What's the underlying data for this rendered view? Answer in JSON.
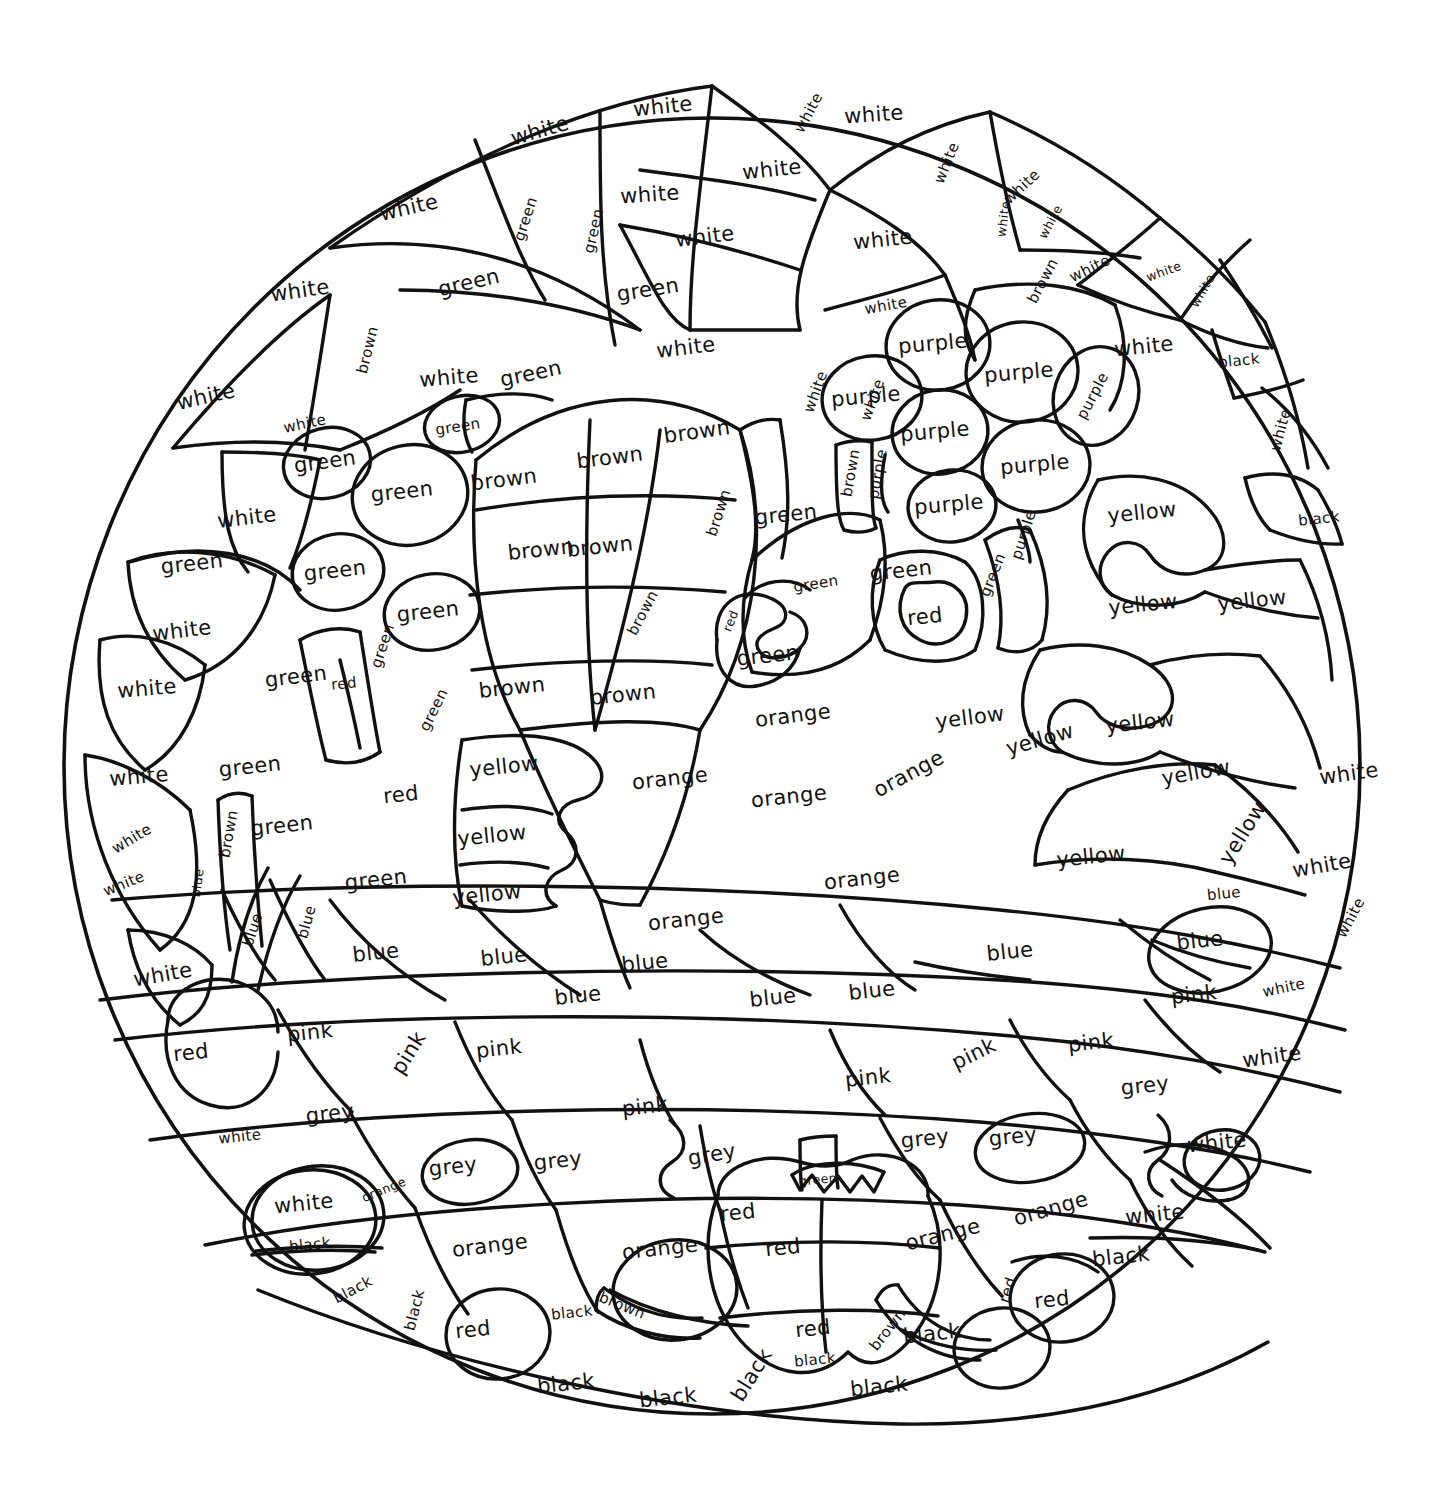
{
  "page": {
    "kind": "color-by-word-coloring-sheet",
    "shape": "circle-mandala",
    "background": "#ffffff",
    "ink": "#111111",
    "width": 1453,
    "height": 1509
  },
  "palette": {
    "white": "#ffffff",
    "green": "#2e8b36",
    "brown": "#7b4a21",
    "purple": "#7b3fa0",
    "yellow": "#f2c232",
    "orange": "#ef8127",
    "red": "#d8352a",
    "blue": "#2f6fd0",
    "pink": "#ef8bb6",
    "grey": "#8c8c8c",
    "black": "#111111"
  },
  "legend_words": [
    "white",
    "green",
    "brown",
    "purple",
    "yellow",
    "orange",
    "red",
    "blue",
    "pink",
    "grey",
    "black"
  ],
  "regions": [
    {
      "text": "white",
      "x": 540,
      "y": 131,
      "rot": -16,
      "size": "lg"
    },
    {
      "text": "white",
      "x": 663,
      "y": 107,
      "rot": -6,
      "size": "lg"
    },
    {
      "text": "white",
      "x": 809,
      "y": 113,
      "rot": -62,
      "size": "sm"
    },
    {
      "text": "white",
      "x": 874,
      "y": 115,
      "rot": -4,
      "size": "lg"
    },
    {
      "text": "white",
      "x": 409,
      "y": 208,
      "rot": -13,
      "size": "lg"
    },
    {
      "text": "white",
      "x": 650,
      "y": 195,
      "rot": -4,
      "size": "lg"
    },
    {
      "text": "white",
      "x": 772,
      "y": 170,
      "rot": -6,
      "size": "lg"
    },
    {
      "text": "white",
      "x": 947,
      "y": 163,
      "rot": -68,
      "size": "sm"
    },
    {
      "text": "white",
      "x": 1022,
      "y": 187,
      "rot": -43,
      "size": "sm"
    },
    {
      "text": "white",
      "x": 1004,
      "y": 219,
      "rot": -82,
      "size": "xs"
    },
    {
      "text": "white",
      "x": 1051,
      "y": 222,
      "rot": -62,
      "size": "xs"
    },
    {
      "text": "white",
      "x": 300,
      "y": 291,
      "rot": -8,
      "size": "lg"
    },
    {
      "text": "white",
      "x": 705,
      "y": 237,
      "rot": -7,
      "size": "lg"
    },
    {
      "text": "white",
      "x": 883,
      "y": 240,
      "rot": -6,
      "size": "lg"
    },
    {
      "text": "white",
      "x": 1090,
      "y": 269,
      "rot": -26,
      "size": "sm"
    },
    {
      "text": "white",
      "x": 1164,
      "y": 272,
      "rot": -20,
      "size": "xs"
    },
    {
      "text": "white",
      "x": 1203,
      "y": 291,
      "rot": -60,
      "size": "xs"
    },
    {
      "text": "white",
      "x": 886,
      "y": 306,
      "rot": -10,
      "size": "sm"
    },
    {
      "text": "white",
      "x": 1144,
      "y": 347,
      "rot": -6,
      "size": "lg"
    },
    {
      "text": "white",
      "x": 206,
      "y": 397,
      "rot": -13,
      "size": "lg"
    },
    {
      "text": "white",
      "x": 449,
      "y": 378,
      "rot": -5,
      "size": "lg"
    },
    {
      "text": "white",
      "x": 686,
      "y": 348,
      "rot": -7,
      "size": "lg"
    },
    {
      "text": "white",
      "x": 816,
      "y": 392,
      "rot": -70,
      "size": "sm"
    },
    {
      "text": "white",
      "x": 873,
      "y": 400,
      "rot": -70,
      "size": "sm"
    },
    {
      "text": "white",
      "x": 305,
      "y": 424,
      "rot": -12,
      "size": "sm"
    },
    {
      "text": "white",
      "x": 1281,
      "y": 430,
      "rot": -75,
      "size": "sm"
    },
    {
      "text": "white",
      "x": 247,
      "y": 518,
      "rot": -7,
      "size": "lg"
    },
    {
      "text": "white",
      "x": 182,
      "y": 631,
      "rot": -7,
      "size": "lg"
    },
    {
      "text": "white",
      "x": 147,
      "y": 689,
      "rot": -5,
      "size": "lg"
    },
    {
      "text": "white",
      "x": 139,
      "y": 777,
      "rot": -5,
      "size": "lg"
    },
    {
      "text": "white",
      "x": 132,
      "y": 839,
      "rot": -31,
      "size": "sm"
    },
    {
      "text": "white",
      "x": 124,
      "y": 884,
      "rot": -22,
      "size": "sm"
    },
    {
      "text": "white",
      "x": 163,
      "y": 975,
      "rot": -10,
      "size": "lg"
    },
    {
      "text": "white",
      "x": 1349,
      "y": 774,
      "rot": -8,
      "size": "lg"
    },
    {
      "text": "white",
      "x": 1322,
      "y": 866,
      "rot": -10,
      "size": "lg"
    },
    {
      "text": "white",
      "x": 1351,
      "y": 918,
      "rot": -62,
      "size": "sm"
    },
    {
      "text": "white",
      "x": 1284,
      "y": 988,
      "rot": -12,
      "size": "sm"
    },
    {
      "text": "white",
      "x": 1272,
      "y": 1057,
      "rot": -8,
      "size": "lg"
    },
    {
      "text": "white",
      "x": 1217,
      "y": 1143,
      "rot": -6,
      "size": "lg"
    },
    {
      "text": "white",
      "x": 1155,
      "y": 1215,
      "rot": -6,
      "size": "lg"
    },
    {
      "text": "white",
      "x": 240,
      "y": 1137,
      "rot": -6,
      "size": "sm"
    },
    {
      "text": "white",
      "x": 304,
      "y": 1204,
      "rot": -6,
      "size": "lg"
    },
    {
      "text": "green",
      "x": 526,
      "y": 219,
      "rot": -72,
      "size": "sm"
    },
    {
      "text": "green",
      "x": 594,
      "y": 231,
      "rot": -77,
      "size": "sm"
    },
    {
      "text": "green",
      "x": 469,
      "y": 283,
      "rot": -13,
      "size": "lg"
    },
    {
      "text": "green",
      "x": 648,
      "y": 290,
      "rot": -9,
      "size": "lg"
    },
    {
      "text": "green",
      "x": 531,
      "y": 374,
      "rot": -12,
      "size": "lg"
    },
    {
      "text": "green",
      "x": 458,
      "y": 427,
      "rot": -9,
      "size": "sm"
    },
    {
      "text": "green",
      "x": 325,
      "y": 462,
      "rot": -8,
      "size": "lg"
    },
    {
      "text": "green",
      "x": 402,
      "y": 492,
      "rot": -6,
      "size": "lg"
    },
    {
      "text": "green",
      "x": 192,
      "y": 564,
      "rot": -6,
      "size": "lg"
    },
    {
      "text": "green",
      "x": 335,
      "y": 571,
      "rot": -6,
      "size": "lg"
    },
    {
      "text": "green",
      "x": 428,
      "y": 612,
      "rot": -6,
      "size": "lg"
    },
    {
      "text": "green",
      "x": 383,
      "y": 646,
      "rot": -72,
      "size": "sm"
    },
    {
      "text": "green",
      "x": 296,
      "y": 677,
      "rot": -7,
      "size": "lg"
    },
    {
      "text": "green",
      "x": 434,
      "y": 710,
      "rot": -64,
      "size": "sm"
    },
    {
      "text": "green",
      "x": 250,
      "y": 767,
      "rot": -6,
      "size": "lg"
    },
    {
      "text": "green",
      "x": 282,
      "y": 826,
      "rot": -6,
      "size": "lg"
    },
    {
      "text": "green",
      "x": 376,
      "y": 880,
      "rot": -6,
      "size": "lg"
    },
    {
      "text": "green",
      "x": 786,
      "y": 515,
      "rot": -6,
      "size": "lg"
    },
    {
      "text": "green",
      "x": 816,
      "y": 584,
      "rot": -9,
      "size": "sm"
    },
    {
      "text": "green",
      "x": 768,
      "y": 656,
      "rot": -6,
      "size": "lg"
    },
    {
      "text": "green",
      "x": 901,
      "y": 571,
      "rot": -6,
      "size": "lg"
    },
    {
      "text": "green",
      "x": 993,
      "y": 575,
      "rot": -68,
      "size": "sm"
    },
    {
      "text": "green",
      "x": 818,
      "y": 1180,
      "rot": -5,
      "size": "xs"
    },
    {
      "text": "brown",
      "x": 368,
      "y": 350,
      "rot": -76,
      "size": "sm"
    },
    {
      "text": "brown",
      "x": 697,
      "y": 432,
      "rot": -8,
      "size": "lg"
    },
    {
      "text": "brown",
      "x": 610,
      "y": 458,
      "rot": -7,
      "size": "lg"
    },
    {
      "text": "brown",
      "x": 504,
      "y": 480,
      "rot": -7,
      "size": "lg"
    },
    {
      "text": "brown",
      "x": 541,
      "y": 550,
      "rot": -6,
      "size": "lg"
    },
    {
      "text": "brown",
      "x": 600,
      "y": 547,
      "rot": -6,
      "size": "lg"
    },
    {
      "text": "brown",
      "x": 719,
      "y": 513,
      "rot": -72,
      "size": "sm"
    },
    {
      "text": "brown",
      "x": 643,
      "y": 613,
      "rot": -62,
      "size": "sm"
    },
    {
      "text": "brown",
      "x": 512,
      "y": 688,
      "rot": -6,
      "size": "lg"
    },
    {
      "text": "brown",
      "x": 623,
      "y": 695,
      "rot": -6,
      "size": "lg"
    },
    {
      "text": "brown",
      "x": 851,
      "y": 473,
      "rot": -80,
      "size": "sm"
    },
    {
      "text": "brown",
      "x": 1043,
      "y": 281,
      "rot": -62,
      "size": "sm"
    },
    {
      "text": "brown",
      "x": 229,
      "y": 834,
      "rot": -80,
      "size": "sm"
    },
    {
      "text": "brown",
      "x": 622,
      "y": 1306,
      "rot": 22,
      "size": "sm"
    },
    {
      "text": "brown",
      "x": 888,
      "y": 1330,
      "rot": -52,
      "size": "sm"
    },
    {
      "text": "purple",
      "x": 933,
      "y": 344,
      "rot": -5,
      "size": "lg"
    },
    {
      "text": "purple",
      "x": 1019,
      "y": 373,
      "rot": -5,
      "size": "lg"
    },
    {
      "text": "purple",
      "x": 866,
      "y": 397,
      "rot": -5,
      "size": "lg"
    },
    {
      "text": "purple",
      "x": 935,
      "y": 432,
      "rot": -5,
      "size": "lg"
    },
    {
      "text": "purple",
      "x": 1093,
      "y": 396,
      "rot": -62,
      "size": "sm"
    },
    {
      "text": "purple",
      "x": 1035,
      "y": 465,
      "rot": -5,
      "size": "lg"
    },
    {
      "text": "purple",
      "x": 878,
      "y": 474,
      "rot": -80,
      "size": "sm"
    },
    {
      "text": "purple",
      "x": 949,
      "y": 505,
      "rot": -5,
      "size": "lg"
    },
    {
      "text": "purple",
      "x": 1024,
      "y": 535,
      "rot": -72,
      "size": "sm"
    },
    {
      "text": "yellow",
      "x": 1142,
      "y": 513,
      "rot": -6,
      "size": "lg"
    },
    {
      "text": "yellow",
      "x": 1143,
      "y": 605,
      "rot": -6,
      "size": "lg"
    },
    {
      "text": "yellow",
      "x": 1252,
      "y": 601,
      "rot": -6,
      "size": "lg"
    },
    {
      "text": "yellow",
      "x": 970,
      "y": 718,
      "rot": -7,
      "size": "lg"
    },
    {
      "text": "yellow",
      "x": 1040,
      "y": 740,
      "rot": -16,
      "size": "lg"
    },
    {
      "text": "yellow",
      "x": 1140,
      "y": 723,
      "rot": -6,
      "size": "lg"
    },
    {
      "text": "yellow",
      "x": 1196,
      "y": 773,
      "rot": -10,
      "size": "lg"
    },
    {
      "text": "yellow",
      "x": 1243,
      "y": 833,
      "rot": -58,
      "size": "lg"
    },
    {
      "text": "yellow",
      "x": 1091,
      "y": 857,
      "rot": -6,
      "size": "lg"
    },
    {
      "text": "yellow",
      "x": 504,
      "y": 767,
      "rot": -6,
      "size": "lg"
    },
    {
      "text": "yellow",
      "x": 492,
      "y": 836,
      "rot": -6,
      "size": "lg"
    },
    {
      "text": "yellow",
      "x": 487,
      "y": 895,
      "rot": -6,
      "size": "lg"
    },
    {
      "text": "orange",
      "x": 793,
      "y": 716,
      "rot": -7,
      "size": "lg"
    },
    {
      "text": "orange",
      "x": 670,
      "y": 779,
      "rot": -6,
      "size": "lg"
    },
    {
      "text": "orange",
      "x": 789,
      "y": 797,
      "rot": -6,
      "size": "lg"
    },
    {
      "text": "orange",
      "x": 909,
      "y": 774,
      "rot": -28,
      "size": "lg"
    },
    {
      "text": "orange",
      "x": 862,
      "y": 879,
      "rot": -6,
      "size": "lg"
    },
    {
      "text": "orange",
      "x": 686,
      "y": 920,
      "rot": -6,
      "size": "lg"
    },
    {
      "text": "orange",
      "x": 384,
      "y": 1190,
      "rot": -22,
      "size": "xs"
    },
    {
      "text": "orange",
      "x": 490,
      "y": 1246,
      "rot": -7,
      "size": "lg"
    },
    {
      "text": "orange",
      "x": 660,
      "y": 1249,
      "rot": -6,
      "size": "lg"
    },
    {
      "text": "orange",
      "x": 943,
      "y": 1235,
      "rot": -14,
      "size": "lg"
    },
    {
      "text": "orange",
      "x": 1051,
      "y": 1209,
      "rot": -16,
      "size": "lg"
    },
    {
      "text": "red",
      "x": 731,
      "y": 621,
      "rot": -68,
      "size": "xs"
    },
    {
      "text": "red",
      "x": 925,
      "y": 617,
      "rot": -6,
      "size": "lg"
    },
    {
      "text": "red",
      "x": 344,
      "y": 684,
      "rot": -6,
      "size": "sm"
    },
    {
      "text": "red",
      "x": 401,
      "y": 795,
      "rot": -6,
      "size": "lg"
    },
    {
      "text": "red",
      "x": 191,
      "y": 1053,
      "rot": -6,
      "size": "lg"
    },
    {
      "text": "red",
      "x": 738,
      "y": 1213,
      "rot": -6,
      "size": "lg"
    },
    {
      "text": "red",
      "x": 783,
      "y": 1248,
      "rot": -6,
      "size": "lg"
    },
    {
      "text": "red",
      "x": 813,
      "y": 1329,
      "rot": -6,
      "size": "lg"
    },
    {
      "text": "red",
      "x": 473,
      "y": 1330,
      "rot": -6,
      "size": "lg"
    },
    {
      "text": "red",
      "x": 1008,
      "y": 1290,
      "rot": -72,
      "size": "sm"
    },
    {
      "text": "red",
      "x": 1052,
      "y": 1300,
      "rot": -6,
      "size": "lg"
    },
    {
      "text": "blue",
      "x": 198,
      "y": 883,
      "rot": -82,
      "size": "xs"
    },
    {
      "text": "blue",
      "x": 253,
      "y": 930,
      "rot": -72,
      "size": "sm"
    },
    {
      "text": "blue",
      "x": 307,
      "y": 922,
      "rot": -74,
      "size": "sm"
    },
    {
      "text": "blue",
      "x": 376,
      "y": 953,
      "rot": -6,
      "size": "lg"
    },
    {
      "text": "blue",
      "x": 504,
      "y": 957,
      "rot": -6,
      "size": "lg"
    },
    {
      "text": "blue",
      "x": 578,
      "y": 996,
      "rot": -6,
      "size": "lg"
    },
    {
      "text": "blue",
      "x": 645,
      "y": 963,
      "rot": -6,
      "size": "lg"
    },
    {
      "text": "blue",
      "x": 773,
      "y": 998,
      "rot": -6,
      "size": "lg"
    },
    {
      "text": "blue",
      "x": 872,
      "y": 991,
      "rot": -6,
      "size": "lg"
    },
    {
      "text": "blue",
      "x": 1010,
      "y": 952,
      "rot": -6,
      "size": "lg"
    },
    {
      "text": "blue",
      "x": 1224,
      "y": 894,
      "rot": -6,
      "size": "sm"
    },
    {
      "text": "blue",
      "x": 1200,
      "y": 941,
      "rot": -6,
      "size": "lg"
    },
    {
      "text": "pink",
      "x": 310,
      "y": 1033,
      "rot": -6,
      "size": "lg"
    },
    {
      "text": "pink",
      "x": 409,
      "y": 1053,
      "rot": -58,
      "size": "lg"
    },
    {
      "text": "pink",
      "x": 499,
      "y": 1049,
      "rot": -6,
      "size": "lg"
    },
    {
      "text": "pink",
      "x": 645,
      "y": 1107,
      "rot": -6,
      "size": "lg"
    },
    {
      "text": "pink",
      "x": 868,
      "y": 1078,
      "rot": -6,
      "size": "lg"
    },
    {
      "text": "pink",
      "x": 974,
      "y": 1054,
      "rot": -26,
      "size": "lg"
    },
    {
      "text": "pink",
      "x": 1091,
      "y": 1043,
      "rot": -6,
      "size": "lg"
    },
    {
      "text": "pink",
      "x": 1194,
      "y": 995,
      "rot": -6,
      "size": "lg"
    },
    {
      "text": "grey",
      "x": 330,
      "y": 1114,
      "rot": -6,
      "size": "lg"
    },
    {
      "text": "grey",
      "x": 453,
      "y": 1167,
      "rot": -6,
      "size": "lg"
    },
    {
      "text": "grey",
      "x": 558,
      "y": 1161,
      "rot": -6,
      "size": "lg"
    },
    {
      "text": "grey",
      "x": 712,
      "y": 1155,
      "rot": -10,
      "size": "lg"
    },
    {
      "text": "grey",
      "x": 925,
      "y": 1139,
      "rot": -6,
      "size": "lg"
    },
    {
      "text": "grey",
      "x": 1013,
      "y": 1137,
      "rot": -6,
      "size": "lg"
    },
    {
      "text": "grey",
      "x": 1145,
      "y": 1086,
      "rot": -6,
      "size": "lg"
    },
    {
      "text": "black",
      "x": 1239,
      "y": 361,
      "rot": -6,
      "size": "sm"
    },
    {
      "text": "black",
      "x": 1319,
      "y": 519,
      "rot": -6,
      "size": "sm"
    },
    {
      "text": "black",
      "x": 310,
      "y": 1245,
      "rot": -6,
      "size": "sm"
    },
    {
      "text": "black",
      "x": 353,
      "y": 1290,
      "rot": -28,
      "size": "sm"
    },
    {
      "text": "black",
      "x": 415,
      "y": 1310,
      "rot": -76,
      "size": "sm"
    },
    {
      "text": "black",
      "x": 572,
      "y": 1313,
      "rot": -6,
      "size": "sm"
    },
    {
      "text": "black",
      "x": 566,
      "y": 1384,
      "rot": -6,
      "size": "lg"
    },
    {
      "text": "black",
      "x": 668,
      "y": 1398,
      "rot": -6,
      "size": "lg"
    },
    {
      "text": "black",
      "x": 752,
      "y": 1375,
      "rot": -58,
      "size": "lg"
    },
    {
      "text": "black",
      "x": 815,
      "y": 1360,
      "rot": -6,
      "size": "sm"
    },
    {
      "text": "black",
      "x": 879,
      "y": 1387,
      "rot": -6,
      "size": "lg"
    },
    {
      "text": "black",
      "x": 932,
      "y": 1334,
      "rot": -6,
      "size": "lg"
    },
    {
      "text": "black",
      "x": 1121,
      "y": 1257,
      "rot": -6,
      "size": "lg"
    }
  ]
}
